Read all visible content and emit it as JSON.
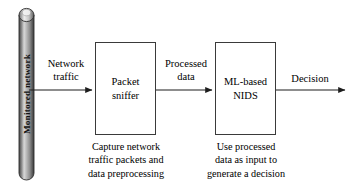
{
  "diagram": {
    "colors": {
      "stroke": "#3a3a3a",
      "arrow": "#222222",
      "text": "#000000",
      "cylinder_dark": "#3f3f3f",
      "cylinder_mid": "#9a9a9a",
      "cylinder_light": "#e8e8e8",
      "background": "#ffffff"
    },
    "source": {
      "name": "monitored-network-cylinder",
      "label": "Monitored network",
      "shape": "cylinder"
    },
    "nodes": [
      {
        "id": "packet-sniffer",
        "label": "Packet\nsniffer",
        "label_line1": "Packet",
        "label_line2": "sniffer",
        "caption": "Capture network traffic packets and data preprocessing",
        "caption_line1": "Capture network",
        "caption_line2": "traffic packets and",
        "caption_line3": "data preprocessing"
      },
      {
        "id": "ml-based-nids",
        "label": "ML-based\nNIDS",
        "label_line1": "ML-based",
        "label_line2": "NIDS",
        "caption": "Use processed data as input to generate a decision",
        "caption_line1": "Use processed",
        "caption_line2": "data as input to",
        "caption_line3": "generate a decision"
      }
    ],
    "edges": [
      {
        "id": "edge-network-traffic",
        "label": "Network traffic",
        "label_line1": "Network",
        "label_line2": "traffic",
        "from": "monitored-network-cylinder",
        "to": "packet-sniffer"
      },
      {
        "id": "edge-processed-data",
        "label": "Processed data",
        "label_line1": "Processed",
        "label_line2": "data",
        "from": "packet-sniffer",
        "to": "ml-based-nids"
      },
      {
        "id": "edge-decision",
        "label": "Decision",
        "label_line1": "Decision",
        "label_line2": "",
        "from": "ml-based-nids",
        "to": "output"
      }
    ]
  }
}
